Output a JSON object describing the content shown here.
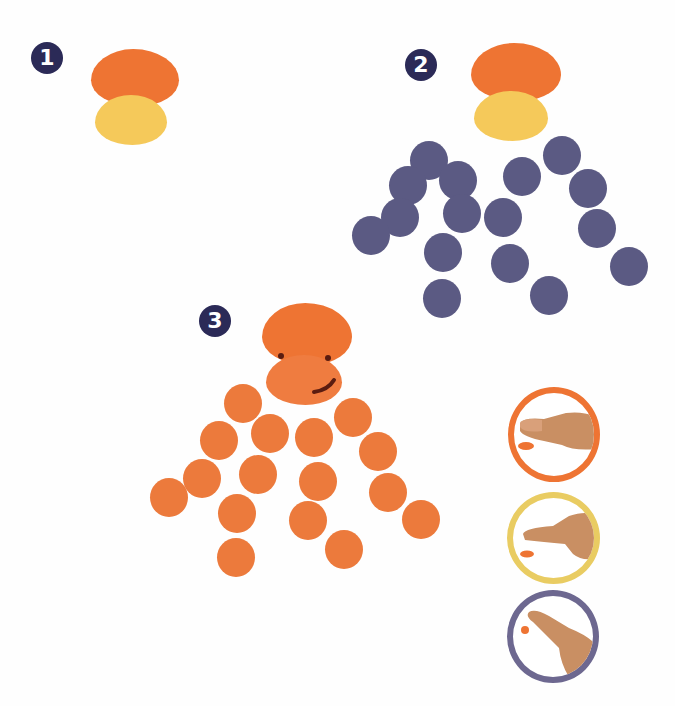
{
  "colors": {
    "head_orange": "#ee7433",
    "face_yellow": "#f5c95a",
    "tentacle_purple": "#5b5a83",
    "tentacle_orange": "#ec7a3c",
    "badge_navy": "#2b2a57",
    "feature_brown": "#5a1c10",
    "ring_orange": "#ee7433",
    "ring_yellow": "#e9cc62",
    "ring_purple": "#6d6890",
    "skin": "#c98f63"
  },
  "steps": [
    {
      "number": "1",
      "description": "Orange head print above yellow face print"
    },
    {
      "number": "2",
      "description": "Add purple fingertip dots as tentacles"
    },
    {
      "number": "3",
      "description": "Finished orange octopus with eyes and smile"
    }
  ],
  "technique_legend": [
    {
      "name": "thumb-print",
      "ring_color": "orange"
    },
    {
      "name": "index-finger-side-print",
      "ring_color": "yellow"
    },
    {
      "name": "fingertip-print",
      "ring_color": "purple"
    }
  ],
  "tentacle_dots_step2": [
    [
      429,
      160
    ],
    [
      408,
      185
    ],
    [
      458,
      180
    ],
    [
      400,
      217
    ],
    [
      462,
      213
    ],
    [
      371,
      235
    ],
    [
      443,
      252
    ],
    [
      442,
      298
    ],
    [
      522,
      176
    ],
    [
      503,
      217
    ],
    [
      510,
      263
    ],
    [
      549,
      295
    ],
    [
      562,
      155
    ],
    [
      588,
      188
    ],
    [
      597,
      228
    ],
    [
      629,
      266
    ]
  ],
  "tentacle_dots_step3": [
    [
      243,
      403
    ],
    [
      219,
      440
    ],
    [
      270,
      433
    ],
    [
      202,
      478
    ],
    [
      258,
      474
    ],
    [
      169,
      497
    ],
    [
      237,
      513
    ],
    [
      236,
      557
    ],
    [
      314,
      437
    ],
    [
      318,
      481
    ],
    [
      308,
      520
    ],
    [
      344,
      549
    ],
    [
      353,
      417
    ],
    [
      378,
      451
    ],
    [
      388,
      492
    ],
    [
      421,
      519
    ]
  ]
}
